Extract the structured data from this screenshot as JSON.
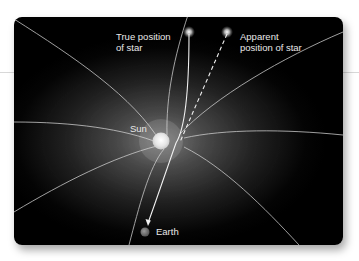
{
  "diagram": {
    "labels": {
      "true_position_line1": "True position",
      "true_position_line2": "of star",
      "apparent_position_line1": "Apparent",
      "apparent_position_line2": "position of star",
      "sun": "Sun",
      "earth": "Earth"
    },
    "elements": [
      {
        "id": "true-star",
        "label": "True position of star",
        "kind": "star"
      },
      {
        "id": "apparent-star",
        "label": "Apparent position of star",
        "kind": "star"
      },
      {
        "id": "sun",
        "label": "Sun",
        "kind": "body"
      },
      {
        "id": "earth",
        "label": "Earth",
        "kind": "body"
      },
      {
        "id": "light-path",
        "kind": "solid-arrow",
        "from": "true-star",
        "to": "earth",
        "note": "bent path passing near the Sun"
      },
      {
        "id": "apparent-line",
        "kind": "dashed-line",
        "from": "apparent-star",
        "to": "earth",
        "note": "straight line of sight"
      },
      {
        "id": "field-lines",
        "kind": "curved-lines",
        "note": "spacetime curvature lines converging on the Sun"
      }
    ],
    "colors": {
      "background": "#000000",
      "glow": "#7a7a7a",
      "lines": "#d0d0d0",
      "text": "#e8e8e8",
      "earth": "#777777"
    }
  }
}
